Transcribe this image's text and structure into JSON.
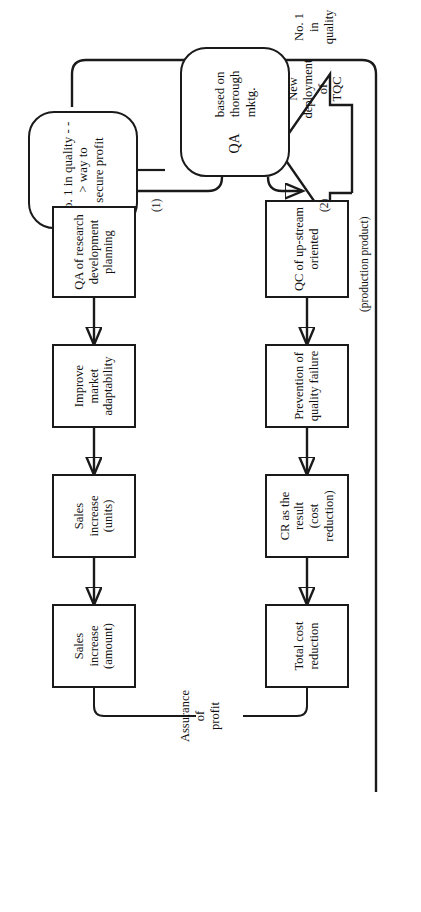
{
  "figure": {
    "type": "flowchart",
    "orientation": "rotated-90-ccw",
    "goal_banner": "No. 1 in quality - - >  way to\nsecure profit",
    "outcome_label": "Assurance\nof\nprofit",
    "driver": {
      "house_label": "New\ndeployment\nof\nTQC",
      "house_caption": "No. 1\nin\nquality"
    },
    "hub": {
      "title": "QA",
      "subtitle": "based on\nthorough\nmktg."
    },
    "branches": [
      {
        "marker": "(1)",
        "caption": "",
        "nodes": [
          "QA of research\ndevelopment\nplanning",
          "Improve\nmarket\nadaptability",
          "Sales\nincrease\n(units)",
          "Sales\nincrease\n(amount)"
        ]
      },
      {
        "marker": "(2)",
        "caption": "(production product)",
        "nodes": [
          "QC of up-stream\noriented",
          "Prevention of\nquality failure",
          "CR as the result\n(cost reduction)",
          "Total cost\nreduction"
        ]
      }
    ],
    "colors": {
      "ink": "#1a1a1a",
      "paper": "#ffffff"
    }
  }
}
